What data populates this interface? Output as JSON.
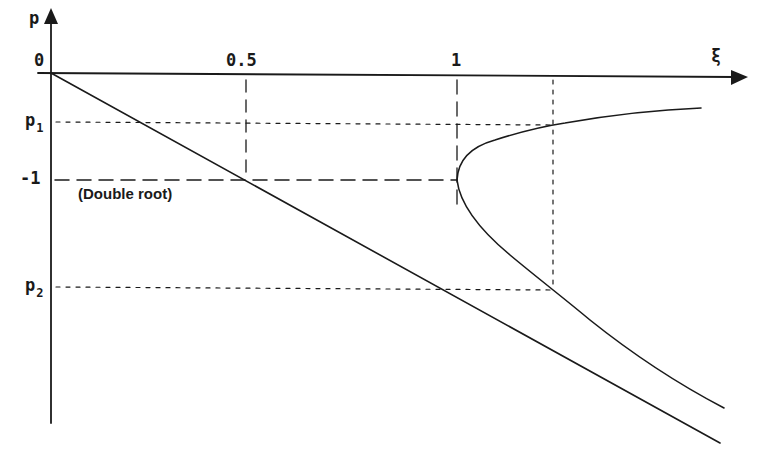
{
  "figure": {
    "y_axis_label": "p",
    "x_axis_label": "ξ",
    "x_ticks": [
      {
        "label": "0",
        "value": 0
      },
      {
        "label": "0.5",
        "value": 0.5
      },
      {
        "label": "1",
        "value": 1
      }
    ],
    "y_ticks": [
      {
        "label": "p",
        "subscript": "1",
        "role": "upper root at marked ξ"
      },
      {
        "label": "-1",
        "value": -1
      },
      {
        "label": "p",
        "subscript": "2",
        "role": "lower root at marked ξ"
      }
    ],
    "annotation": "(Double root)",
    "curves": [
      {
        "name": "straight line",
        "description": "p = -2ξ, line from origin through (0.5, -1)"
      },
      {
        "name": "root branches",
        "description": "p = -ξ ± √(ξ² − 1), real for ξ ≥ 1, vertex at (1, -1)"
      }
    ],
    "guides": [
      {
        "type": "dashed",
        "description": "vertical at ξ = 0.5 down to p = -1"
      },
      {
        "type": "dashed",
        "description": "vertical at ξ = 1"
      },
      {
        "type": "dashed",
        "description": "horizontal at p = -1 from axis to ξ = 1"
      },
      {
        "type": "dotted",
        "description": "horizontal at p1"
      },
      {
        "type": "dotted",
        "description": "horizontal at p2"
      },
      {
        "type": "dotted",
        "description": "vertical at marked ξ > 1 from axis to p2"
      }
    ],
    "colors": {
      "ink": "#1a1a1a",
      "background": "#ffffff"
    }
  }
}
